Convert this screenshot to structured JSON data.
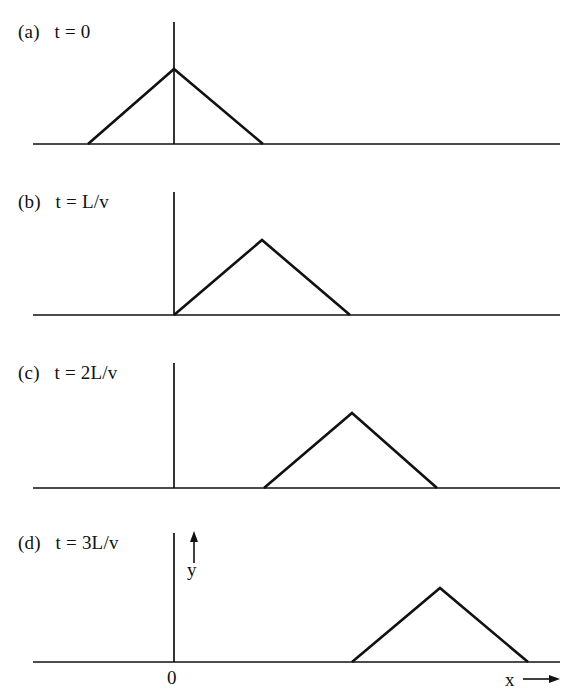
{
  "figure": {
    "background_color": "#ffffff",
    "ink_color": "#111111",
    "panels": [
      {
        "id": "a",
        "label": "(a)   t = 0",
        "tag": "(a)",
        "time_label": "t = 0",
        "time_value": "0"
      },
      {
        "id": "b",
        "label": "(b)   t = L/v",
        "tag": "(b)",
        "time_label": "t = L/v",
        "time_value": "L/v"
      },
      {
        "id": "c",
        "label": "(c)   t = 2L/v",
        "tag": "(c)",
        "time_label": "t = 2L/v",
        "time_value": "2L/v"
      },
      {
        "id": "d",
        "label": "(d)   t = 3L/v",
        "tag": "(d)",
        "time_label": "t = 3L/v",
        "time_value": "3L/v"
      }
    ],
    "axis_labels": {
      "origin": "0",
      "y": "y",
      "x": "x",
      "x_arrow": "⟶"
    }
  },
  "chart_data": {
    "type": "line",
    "xlabel": "x",
    "ylabel": "y",
    "grid": false,
    "legend": null,
    "shared_x_axis": {
      "origin_pixel_x": 174,
      "axis_start_pixel_x": 33,
      "axis_end_pixel_x": 560,
      "tick_labels": [
        "0"
      ]
    },
    "panels": [
      {
        "name": "(a) t = 0",
        "time": "0",
        "baseline_y_px": 144,
        "y_axis_top_px": 22,
        "peak_y_px": 69,
        "x_px": [
          33,
          88,
          174,
          263,
          560
        ],
        "y_px": [
          144,
          144,
          69,
          144,
          144
        ],
        "peak_x_px": 174,
        "foot_left_px": 88,
        "foot_right_px": 263,
        "peak_at_origin": true
      },
      {
        "name": "(b) t = L/v",
        "time": "L/v",
        "baseline_y_px": 315,
        "y_axis_top_px": 192,
        "peak_y_px": 240,
        "x_px": [
          33,
          174,
          262,
          350,
          560
        ],
        "y_px": [
          315,
          315,
          240,
          315,
          315
        ],
        "peak_x_px": 262,
        "foot_left_px": 174,
        "foot_right_px": 350,
        "peak_at_origin": false
      },
      {
        "name": "(c) t = 2L/v",
        "time": "2L/v",
        "baseline_y_px": 488,
        "y_axis_top_px": 363,
        "peak_y_px": 413,
        "x_px": [
          33,
          264,
          352,
          437,
          560
        ],
        "y_px": [
          488,
          488,
          413,
          488,
          488
        ],
        "peak_x_px": 352,
        "foot_left_px": 264,
        "foot_right_px": 437,
        "peak_at_origin": false
      },
      {
        "name": "(d) t = 3L/v",
        "time": "3L/v",
        "baseline_y_px": 662,
        "y_axis_top_px": 533,
        "peak_y_px": 588,
        "x_px": [
          33,
          352,
          440,
          528,
          560
        ],
        "y_px": [
          662,
          662,
          588,
          662,
          662
        ],
        "peak_x_px": 440,
        "foot_left_px": 352,
        "foot_right_px": 528,
        "peak_at_origin": false
      }
    ],
    "annotations": [
      {
        "text": "0",
        "role": "origin-tick-label",
        "x_px": 174,
        "y_px": 682
      },
      {
        "text": "y",
        "role": "y-axis-label",
        "x_px": 193,
        "y_px": 573
      },
      {
        "text": "x",
        "role": "x-axis-label",
        "x_px": 512,
        "y_px": 684
      }
    ]
  }
}
